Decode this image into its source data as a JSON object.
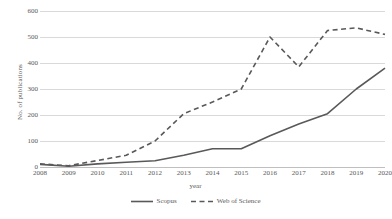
{
  "chart_data": {
    "type": "line",
    "title": "",
    "xlabel": "year",
    "ylabel": "No. of publications",
    "categories": [
      "2008",
      "2009",
      "2010",
      "2011",
      "2012",
      "2013",
      "2014",
      "2015",
      "2016",
      "2017",
      "2018",
      "2019",
      "2020"
    ],
    "x": [
      2008,
      2009,
      2010,
      2011,
      2012,
      2013,
      2014,
      2015,
      2016,
      2017,
      2018,
      2019,
      2020
    ],
    "xlim": [
      2008,
      2020
    ],
    "ylim": [
      0,
      600
    ],
    "yticks": [
      0,
      100,
      200,
      300,
      400,
      500,
      600
    ],
    "ytick_labels": [
      "0",
      "100",
      "200",
      "300",
      "400",
      "500",
      "600"
    ],
    "grid": true,
    "legend_position": "bottom",
    "series": [
      {
        "name": "Scopus",
        "style": "solid",
        "color": "#595959",
        "values": [
          10,
          3,
          12,
          18,
          24,
          45,
          70,
          70,
          120,
          165,
          205,
          300,
          380
        ]
      },
      {
        "name": "Web of Science",
        "style": "dashed",
        "color": "#595959",
        "values": [
          12,
          5,
          25,
          45,
          100,
          205,
          250,
          300,
          500,
          385,
          525,
          535,
          510
        ]
      }
    ]
  },
  "colors": {
    "series": "#595959",
    "gridline": "#d9d9d9",
    "axis": "#bfbfbf",
    "text": "#595959",
    "background": "#ffffff"
  }
}
